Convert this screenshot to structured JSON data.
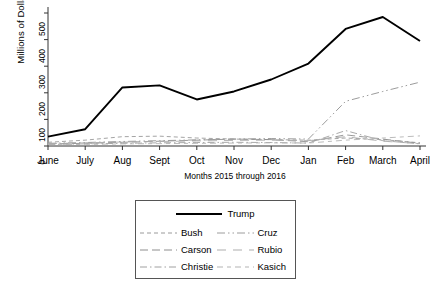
{
  "chart_data": {
    "type": "line",
    "title": "",
    "xlabel": "Months 2015 through 2016",
    "ylabel": "Millions of Dollars",
    "categories": [
      "June",
      "July",
      "Aug",
      "Sept",
      "Oct",
      "Nov",
      "Dec",
      "Jan",
      "Feb",
      "March",
      "April"
    ],
    "xticklabels": [
      "June",
      "July",
      "Aug",
      "Sept",
      "Oct",
      "Nov",
      "Dec",
      "Jan",
      "Feb",
      "March",
      "April"
    ],
    "yticklabels": [
      "0",
      "100",
      "200",
      "300",
      "400",
      "500"
    ],
    "yticks": [
      0,
      100,
      200,
      300,
      400,
      500
    ],
    "ylim": [
      0,
      520
    ],
    "grid": false,
    "legend_position": "below-plot",
    "series": [
      {
        "name": "Trump",
        "style": "solid",
        "color": "#000000",
        "width": 1.9,
        "values": [
          35,
          63,
          220,
          228,
          175,
          205,
          250,
          310,
          440,
          485,
          395
        ]
      },
      {
        "name": "Bush",
        "style": "fine-dash",
        "color": "#9a9a9a",
        "width": 0.9,
        "values": [
          14,
          22,
          35,
          37,
          30,
          26,
          24,
          22,
          30,
          24,
          12
        ]
      },
      {
        "name": "Carson",
        "style": "long-dash",
        "color": "#8e8e8e",
        "width": 0.9,
        "values": [
          8,
          10,
          14,
          18,
          22,
          26,
          24,
          16,
          42,
          26,
          10
        ]
      },
      {
        "name": "Christie",
        "style": "dash-dot",
        "color": "#a0a0a0",
        "width": 0.9,
        "values": [
          6,
          8,
          10,
          12,
          13,
          14,
          13,
          11,
          58,
          20,
          8
        ]
      },
      {
        "name": "Cruz",
        "style": "dash-dot-dot",
        "color": "#9c9c9c",
        "width": 1.0,
        "values": [
          10,
          13,
          17,
          20,
          23,
          26,
          28,
          26,
          168,
          205,
          240
        ]
      },
      {
        "name": "Rubio",
        "style": "long-dash-wide",
        "color": "#adadad",
        "width": 0.9,
        "values": [
          9,
          12,
          15,
          17,
          19,
          21,
          22,
          20,
          35,
          18,
          9
        ]
      },
      {
        "name": "Kasich",
        "style": "dash-dash-dot",
        "color": "#b3b3b3",
        "width": 0.9,
        "values": [
          5,
          6,
          8,
          9,
          10,
          11,
          12,
          11,
          22,
          30,
          38
        ]
      }
    ]
  },
  "legend": {
    "top_entry": "Trump",
    "entries_left": [
      "Bush",
      "Carson",
      "Christie"
    ],
    "entries_right": [
      "Cruz",
      "Rubio",
      "Kasich"
    ]
  }
}
